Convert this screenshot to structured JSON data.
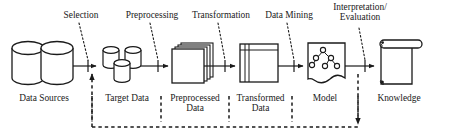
{
  "diagram": {
    "type": "process-flow-diagram",
    "background_color": "#ffffff",
    "stroke_color": "#1a1a1a",
    "text_color": "#1a1a1a",
    "step_labels": [
      {
        "id": "selection",
        "text": "Selection"
      },
      {
        "id": "preprocessing",
        "text": "Preprocessing"
      },
      {
        "id": "transformation",
        "text": "Transformation"
      },
      {
        "id": "data-mining",
        "text": "Data Mining"
      },
      {
        "id": "interpretation-evaluation",
        "text": "Interpretation/\nEvaluation"
      }
    ],
    "stage_labels": [
      {
        "id": "data-sources",
        "text": "Data Sources",
        "icon": "database-cylinders-icon"
      },
      {
        "id": "target-data",
        "text": "Target Data",
        "icon": "small-cylinders-icon"
      },
      {
        "id": "preprocessed-data",
        "text": "Preprocessed\nData",
        "icon": "stacked-sheets-icon"
      },
      {
        "id": "transformed-data",
        "text": "Transformed\nData",
        "icon": "table-document-icon"
      },
      {
        "id": "model",
        "text": "Model",
        "icon": "decision-tree-document-icon"
      },
      {
        "id": "knowledge",
        "text": "Knowledge",
        "icon": "scroll-icon"
      }
    ],
    "feedback_loop": {
      "style": "dashed",
      "direction": "right-to-left",
      "label": "feedback-loop"
    }
  }
}
